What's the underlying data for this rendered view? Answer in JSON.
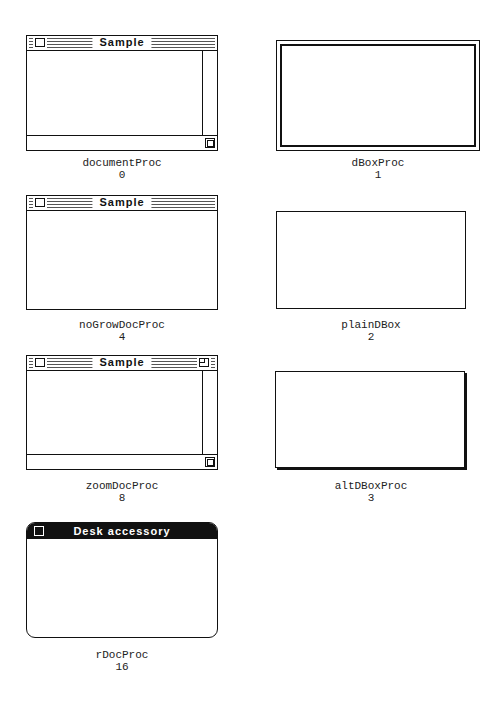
{
  "figure": {
    "items": [
      {
        "proc_name": "documentProc",
        "proc_id": "0",
        "title": "Sample",
        "style": "document",
        "has_grow_box": true,
        "has_zoom_box": false
      },
      {
        "proc_name": "dBoxProc",
        "proc_id": "1",
        "style": "double-border-dialog"
      },
      {
        "proc_name": "noGrowDocProc",
        "proc_id": "4",
        "title": "Sample",
        "style": "document",
        "has_grow_box": false,
        "has_zoom_box": false
      },
      {
        "proc_name": "plainDBox",
        "proc_id": "2",
        "style": "plain-dialog"
      },
      {
        "proc_name": "zoomDocProc",
        "proc_id": "8",
        "title": "Sample",
        "style": "document",
        "has_grow_box": true,
        "has_zoom_box": true
      },
      {
        "proc_name": "altDBoxProc",
        "proc_id": "3",
        "style": "shadowed-dialog"
      },
      {
        "proc_name": "rDocProc",
        "proc_id": "16",
        "title": "Desk accessory",
        "style": "rounded-document"
      }
    ]
  }
}
